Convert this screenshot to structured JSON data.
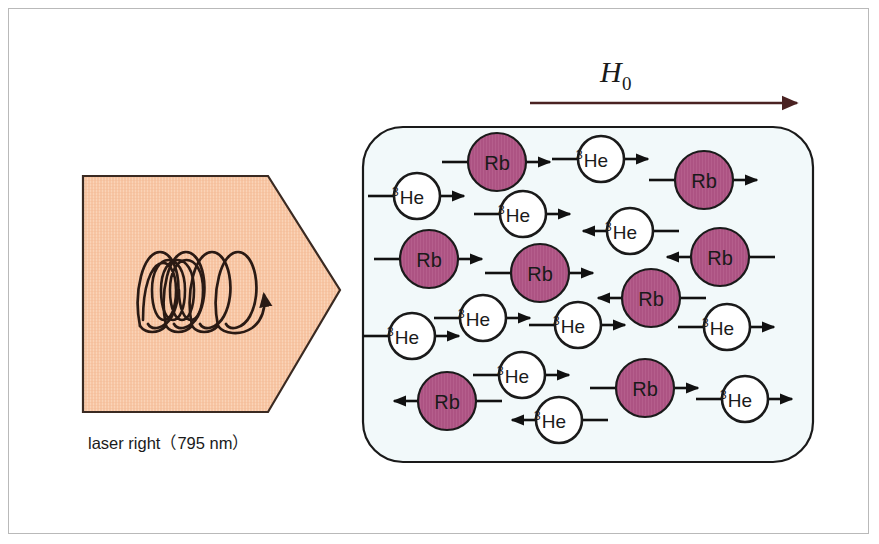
{
  "figure": {
    "background": "#ffffff",
    "frame_color": "#b9b9b9"
  },
  "field": {
    "label": "H",
    "subscript": "0",
    "arrow_color": "#4a2222",
    "arrow_direction": "right",
    "arrow_x1": 530,
    "arrow_x2": 800,
    "arrow_y": 103,
    "label_x": 600,
    "label_y": 80
  },
  "laser": {
    "caption": "laser right（795 nm）",
    "wavelength_nm": 795,
    "handedness": "right",
    "block_fill": "#f7c5a3",
    "block_stroke": "#3a2a22",
    "spiral_color": "#2a1a14",
    "spiral_loops": 4,
    "shape": "pentagon-arrow",
    "caption_x": 190,
    "caption_y": 443
  },
  "cell": {
    "name": "glass-cell",
    "fill": "#f2f9fa",
    "stroke": "#1a1a1a",
    "x": 363,
    "y": 127,
    "width": 450,
    "height": 335,
    "corner_radius": 40
  },
  "species": {
    "rb": {
      "label": "Rb",
      "fill": "#ad5383",
      "stroke": "#1a1a1a",
      "text_color": "#1a1a1a",
      "radius": 29
    },
    "he": {
      "label": "He",
      "superscript": "3",
      "fill": "#ffffff",
      "stroke": "#1a1a1a",
      "text_color": "#1a1a1a",
      "radius": 23
    }
  },
  "particles": [
    {
      "id": "rb-1",
      "type": "rb",
      "cx": 497,
      "cy": 162,
      "dir": "right"
    },
    {
      "id": "he-1",
      "type": "he",
      "cx": 417,
      "cy": 196,
      "dir": "right"
    },
    {
      "id": "he-2",
      "type": "he",
      "cx": 601,
      "cy": 159,
      "dir": "right"
    },
    {
      "id": "rb-2",
      "type": "rb",
      "cx": 704,
      "cy": 180,
      "dir": "right"
    },
    {
      "id": "he-3",
      "type": "he",
      "cx": 523,
      "cy": 214,
      "dir": "right"
    },
    {
      "id": "he-4",
      "type": "he",
      "cx": 630,
      "cy": 231,
      "dir": "left"
    },
    {
      "id": "rb-3",
      "type": "rb",
      "cx": 429,
      "cy": 259,
      "dir": "right"
    },
    {
      "id": "rb-4",
      "type": "rb",
      "cx": 540,
      "cy": 273,
      "dir": "right"
    },
    {
      "id": "rb-5",
      "type": "rb",
      "cx": 720,
      "cy": 257,
      "dir": "left"
    },
    {
      "id": "rb-6",
      "type": "rb",
      "cx": 651,
      "cy": 298,
      "dir": "left"
    },
    {
      "id": "he-5",
      "type": "he",
      "cx": 483,
      "cy": 318,
      "dir": "right"
    },
    {
      "id": "he-6",
      "type": "he",
      "cx": 578,
      "cy": 325,
      "dir": "right"
    },
    {
      "id": "he-7",
      "type": "he",
      "cx": 412,
      "cy": 336,
      "dir": "right"
    },
    {
      "id": "he-8",
      "type": "he",
      "cx": 727,
      "cy": 327,
      "dir": "right"
    },
    {
      "id": "he-9",
      "type": "he",
      "cx": 522,
      "cy": 375,
      "dir": "right"
    },
    {
      "id": "rb-7",
      "type": "rb",
      "cx": 447,
      "cy": 401,
      "dir": "left"
    },
    {
      "id": "rb-8",
      "type": "rb",
      "cx": 645,
      "cy": 388,
      "dir": "right"
    },
    {
      "id": "he-10",
      "type": "he",
      "cx": 745,
      "cy": 399,
      "dir": "right"
    },
    {
      "id": "he-11",
      "type": "he",
      "cx": 559,
      "cy": 420,
      "dir": "left"
    }
  ],
  "counts": {
    "rb": 8,
    "he": 11,
    "total": 19
  }
}
